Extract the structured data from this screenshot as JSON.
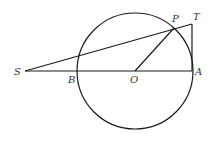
{
  "figure": {
    "type": "geometry-diagram",
    "stroke_color": "#1a1a1a",
    "label_color": "#333333",
    "circle": {
      "center": "O",
      "cx": 135,
      "cy": 71,
      "r": 58
    },
    "points": {
      "S": {
        "label": "S",
        "x": 25,
        "y": 71
      },
      "B": {
        "label": "B",
        "x": 78,
        "y": 71
      },
      "O": {
        "label": "O",
        "x": 135,
        "y": 71
      },
      "A": {
        "label": "A",
        "x": 192,
        "y": 71
      },
      "P": {
        "label": "P",
        "x": 174,
        "y": 28
      },
      "T": {
        "label": "T",
        "x": 192,
        "y": 24
      }
    },
    "segments": [
      {
        "from": "S",
        "to": "A"
      },
      {
        "from": "S",
        "to": "T"
      },
      {
        "from": "O",
        "to": "P"
      },
      {
        "from": "T",
        "to": "A"
      }
    ]
  }
}
